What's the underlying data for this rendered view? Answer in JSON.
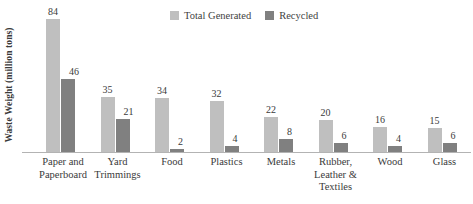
{
  "chart_data": {
    "type": "bar",
    "title": "",
    "xlabel": "",
    "ylabel": "Waste Weight (million tons)",
    "ylim": [
      0,
      90
    ],
    "grid": false,
    "legend_position": "top-center",
    "categories": [
      "Paper and Paperboard",
      "Yard Trimmings",
      "Food",
      "Plastics",
      "Metals",
      "Rubber, Leather & Textiles",
      "Wood",
      "Glass"
    ],
    "category_lines": [
      [
        "Paper and",
        "Paperboard"
      ],
      [
        "Yard",
        "Trimmings"
      ],
      [
        "Food"
      ],
      [
        "Plastics"
      ],
      [
        "Metals"
      ],
      [
        "Rubber,",
        "Leather &",
        "Textiles"
      ],
      [
        "Wood"
      ],
      [
        "Glass"
      ]
    ],
    "series": [
      {
        "name": "Total Generated",
        "color": "#bfbfbf",
        "values": [
          84,
          35,
          34,
          32,
          22,
          20,
          16,
          15
        ]
      },
      {
        "name": "Recycled",
        "color": "#808080",
        "values": [
          46,
          21,
          2,
          4,
          8,
          6,
          4,
          6
        ]
      }
    ]
  },
  "legend": {
    "entries": [
      {
        "label": "Total Generated",
        "color": "#bfbfbf"
      },
      {
        "label": "Recycled",
        "color": "#808080"
      }
    ]
  },
  "axis": {
    "y_title": "Waste Weight (million tons)"
  },
  "colors": {
    "generated": "#bfbfbf",
    "recycled": "#808080",
    "axis_line": "#b3b3b3",
    "text": "#3a3a3a",
    "background": "#ffffff"
  }
}
